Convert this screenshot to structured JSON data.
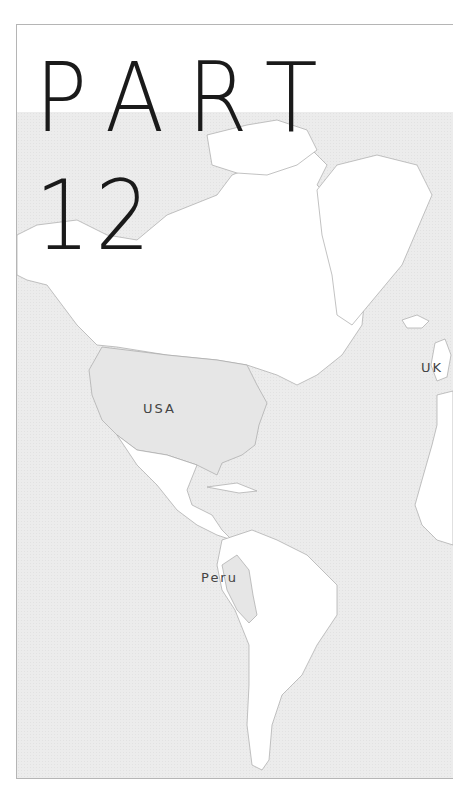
{
  "heading": {
    "line1": "PART",
    "line2": "12"
  },
  "map": {
    "region": "Americas and Atlantic",
    "highlighted_countries": [
      "USA",
      "Peru"
    ],
    "labels": [
      {
        "text": "USA",
        "x": 142,
        "y": 398
      },
      {
        "text": "Peru",
        "x": 200,
        "y": 567
      },
      {
        "text": "UK",
        "x": 420,
        "y": 357
      }
    ],
    "colors": {
      "ocean": "#ececec",
      "land": "#ffffff",
      "highlight": "#e4e4e4",
      "coast": "#9a9a9a",
      "title": "#1a1a1a"
    }
  }
}
